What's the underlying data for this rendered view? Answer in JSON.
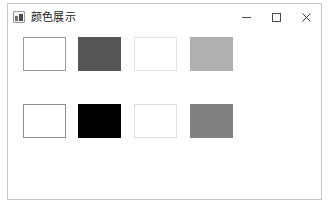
{
  "window": {
    "title": "颜色展示",
    "icon": "app-window-icon",
    "frame_border_color": "#c8c8c8",
    "background_color": "#ffffff",
    "controls": [
      {
        "name": "minimize",
        "glyph": "−",
        "label": "最小化"
      },
      {
        "name": "maximize",
        "glyph": "□",
        "label": "最大化"
      },
      {
        "name": "close",
        "glyph": "×",
        "label": "关闭"
      }
    ]
  },
  "client": {
    "background_color": "#ffffff",
    "rows": [
      {
        "name": "swatch-row-1",
        "swatches": [
          {
            "name": "swatch-1-1",
            "fill": "#ffffff",
            "border": "#9a9a9a"
          },
          {
            "name": "swatch-1-2",
            "fill": "#565656",
            "border": "#565656"
          },
          {
            "name": "swatch-1-3",
            "fill": "#ffffff",
            "border": "#e2e2e2"
          },
          {
            "name": "swatch-1-4",
            "fill": "#b0b0b0",
            "border": "#b0b0b0"
          }
        ]
      },
      {
        "name": "swatch-row-2",
        "swatches": [
          {
            "name": "swatch-2-1",
            "fill": "#ffffff",
            "border": "#8f8f8f"
          },
          {
            "name": "swatch-2-2",
            "fill": "#000000",
            "border": "#000000"
          },
          {
            "name": "swatch-2-3",
            "fill": "#ffffff",
            "border": "#dcdcdc"
          },
          {
            "name": "swatch-2-4",
            "fill": "#808080",
            "border": "#808080"
          }
        ]
      }
    ]
  }
}
